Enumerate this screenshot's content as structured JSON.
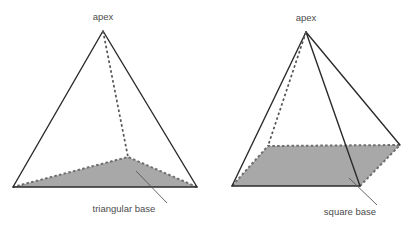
{
  "figure": {
    "title_visible": false,
    "background_color": "#ffffff",
    "stroke_color": "#2b2b2b",
    "dashed_color": "#555555",
    "base_fill_color": "#a8a8a8",
    "base_fill_stroke": "#6f6f6f",
    "label_color": "#4c4c4c",
    "leader_color": "#555555"
  },
  "shapes": [
    {
      "id": "triangular-pyramid",
      "name": "triangular-pyramid",
      "apex_label": "apex",
      "base_label": "triangular base",
      "base_kind": "triangle",
      "apex": {
        "x": 103,
        "y": 31
      },
      "base_vertices": [
        {
          "name": "front-left",
          "x": 13,
          "y": 187
        },
        {
          "name": "front-right",
          "x": 197,
          "y": 187
        },
        {
          "name": "back",
          "x": 128,
          "y": 157
        }
      ],
      "solid_edges": [
        {
          "from": "apex",
          "to": "front-left"
        },
        {
          "from": "apex",
          "to": "front-right"
        },
        {
          "from": "front-left",
          "to": "front-right"
        }
      ],
      "dashed_edges": [
        {
          "from": "apex",
          "to": "back"
        }
      ],
      "apex_label_pos": {
        "x": 103,
        "y": 20
      },
      "base_label_pos": {
        "x": 124,
        "y": 212
      },
      "leader": {
        "x1": 167,
        "y1": 203,
        "x2": 136,
        "y2": 171
      }
    },
    {
      "id": "square-pyramid",
      "name": "square-pyramid",
      "apex_label": "apex",
      "base_label": "square base",
      "base_kind": "square",
      "apex": {
        "x": 306,
        "y": 32
      },
      "base_vertices": [
        {
          "name": "front-left",
          "x": 232,
          "y": 186
        },
        {
          "name": "front-right",
          "x": 360,
          "y": 186
        },
        {
          "name": "back-right",
          "x": 400,
          "y": 145
        },
        {
          "name": "back-left",
          "x": 268,
          "y": 146
        }
      ],
      "solid_edges": [
        {
          "from": "apex",
          "to": "front-left"
        },
        {
          "from": "apex",
          "to": "front-right"
        },
        {
          "from": "apex",
          "to": "back-right"
        },
        {
          "from": "front-left",
          "to": "front-right"
        }
      ],
      "dashed_edges": [
        {
          "from": "apex",
          "to": "back-left"
        }
      ],
      "apex_label_pos": {
        "x": 306,
        "y": 21
      },
      "base_label_pos": {
        "x": 350,
        "y": 215
      },
      "leader": {
        "x1": 377,
        "y1": 205,
        "x2": 349,
        "y2": 178
      }
    }
  ]
}
